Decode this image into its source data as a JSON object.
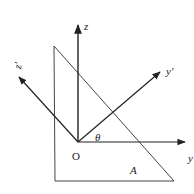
{
  "diagram": {
    "colors": {
      "stroke": "#222222",
      "triangle": "#333333",
      "background": "#ffffff"
    },
    "origin": {
      "label": "O",
      "x": 78,
      "y": 142
    },
    "axes": [
      {
        "id": "z",
        "label": "z",
        "from": [
          78,
          142
        ],
        "to": [
          78,
          24
        ]
      },
      {
        "id": "y",
        "label": "y",
        "from": [
          78,
          142
        ],
        "to": [
          186,
          142
        ]
      },
      {
        "id": "y-prime",
        "label": "y′",
        "from": [
          78,
          142
        ],
        "to": [
          160,
          72
        ]
      },
      {
        "id": "z-prime",
        "label": "z′",
        "from": [
          78,
          142
        ],
        "to": [
          18,
          76
        ]
      }
    ],
    "angle": {
      "label": "θ"
    },
    "triangle": {
      "label": "A",
      "points": [
        [
          54,
          46
        ],
        [
          55,
          181
        ],
        [
          174,
          181
        ]
      ]
    }
  }
}
